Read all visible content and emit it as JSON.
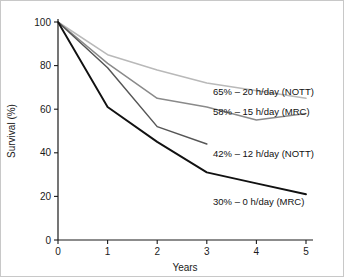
{
  "chart_data": {
    "type": "line",
    "title": "",
    "subtitle": "",
    "xlabel": "Years",
    "ylabel": "Survival (%)",
    "x": [
      0,
      1,
      2,
      3,
      4,
      5
    ],
    "xlim": [
      0,
      5
    ],
    "ylim": [
      0,
      100
    ],
    "xticks": [
      "0",
      "1",
      "2",
      "3",
      "4",
      "5"
    ],
    "yticks": [
      "0",
      "20",
      "40",
      "60",
      "80",
      "100"
    ],
    "grid": false,
    "legend_position": "inline-annotations",
    "series": [
      {
        "name": "20 h/day (NOTT)",
        "label": "65% – 20 h/day (NOTT)",
        "final_value": 65,
        "color": "#b9b9b9",
        "x": [
          0,
          1,
          2,
          3,
          5
        ],
        "values": [
          100,
          85,
          78,
          72,
          65
        ]
      },
      {
        "name": "15 h/day (MRC)",
        "label": "58% – 15 h/day (MRC)",
        "final_value": 58,
        "color": "#8a8a8a",
        "x": [
          0,
          1,
          2,
          3,
          4,
          5
        ],
        "values": [
          100,
          81,
          65,
          61,
          55,
          58
        ]
      },
      {
        "name": "12 h/day (NOTT)",
        "label": "42% – 12 h/day (NOTT)",
        "final_value": 42,
        "color": "#565656",
        "x": [
          0,
          1,
          2,
          3
        ],
        "values": [
          100,
          79,
          52,
          44
        ]
      },
      {
        "name": "0 h/day (MRC)",
        "label": "30% – 0 h/day (MRC)",
        "final_value": 30,
        "color": "#111111",
        "x": [
          0,
          1,
          2,
          3,
          4,
          5
        ],
        "values": [
          100,
          61,
          45,
          31,
          26,
          21
        ]
      }
    ],
    "annotations": [
      {
        "text": "65% – 20 h/day (NOTT)",
        "anchor_x": 212,
        "anchor_y": 94
      },
      {
        "text": "58% – 15 h/day (MRC)",
        "anchor_x": 212,
        "anchor_y": 114
      },
      {
        "text": "42% – 12 h/day (NOTT)",
        "anchor_x": 212,
        "anchor_y": 156
      },
      {
        "text": "30% – 0 h/day (MRC)",
        "anchor_x": 212,
        "anchor_y": 204
      }
    ]
  },
  "axes": {
    "y_title": "Survival (%)",
    "x_title": "Years",
    "y_ticks": [
      {
        "value": "100",
        "y": 21
      },
      {
        "value": "80",
        "y": 64.6
      },
      {
        "value": "60",
        "y": 108.2
      },
      {
        "value": "40",
        "y": 151.8
      },
      {
        "value": "20",
        "y": 195.4
      },
      {
        "value": "0",
        "y": 239
      }
    ],
    "x_ticks": [
      {
        "value": "0",
        "x": 57
      },
      {
        "value": "1",
        "x": 106.6
      },
      {
        "value": "2",
        "x": 156.2
      },
      {
        "value": "3",
        "x": 205.8
      },
      {
        "value": "4",
        "x": 255.4
      },
      {
        "value": "5",
        "x": 305
      }
    ]
  }
}
